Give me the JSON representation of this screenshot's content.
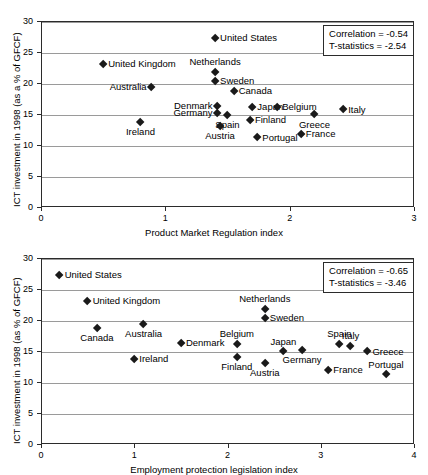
{
  "chart_data": [
    {
      "id": "top",
      "type": "scatter",
      "title": "",
      "xlabel": "Product Market Regulation index",
      "ylabel": "ICT investment in 1998 (as a % of GFCF)",
      "xlim": [
        0,
        3
      ],
      "ylim": [
        0,
        30
      ],
      "xticks": [
        "0",
        "1",
        "2",
        "3"
      ],
      "yticks": [
        "0",
        "5",
        "10",
        "15",
        "20",
        "25",
        "30"
      ],
      "grid": true,
      "annotations": {
        "correlation": "Correlation = -0.54",
        "tstatistics": "T-statistics = -2.54"
      },
      "points": [
        {
          "label": "United States",
          "x": 1.4,
          "y": 27.3,
          "pos": "right"
        },
        {
          "label": "United Kingdom",
          "x": 0.5,
          "y": 23.1,
          "pos": "right"
        },
        {
          "label": "Netherlands",
          "x": 1.4,
          "y": 21.8,
          "pos": "above"
        },
        {
          "label": "Sweden",
          "x": 1.4,
          "y": 20.3,
          "pos": "right"
        },
        {
          "label": "Australia",
          "x": 0.89,
          "y": 19.4,
          "pos": "left"
        },
        {
          "label": "Canada",
          "x": 1.55,
          "y": 18.7,
          "pos": "right"
        },
        {
          "label": "Denmark",
          "x": 1.42,
          "y": 16.3,
          "pos": "left"
        },
        {
          "label": "Japan",
          "x": 1.7,
          "y": 16.1,
          "pos": "right"
        },
        {
          "label": "Belgium",
          "x": 1.9,
          "y": 16.1,
          "pos": "right"
        },
        {
          "label": "Italy",
          "x": 2.43,
          "y": 15.7,
          "pos": "right"
        },
        {
          "label": "Germany",
          "x": 1.42,
          "y": 15.2,
          "pos": "left"
        },
        {
          "label": "Spain",
          "x": 1.5,
          "y": 14.8,
          "pos": "below"
        },
        {
          "label": "Greece",
          "x": 2.2,
          "y": 14.9,
          "pos": "below"
        },
        {
          "label": "Finland",
          "x": 1.68,
          "y": 14.0,
          "pos": "right"
        },
        {
          "label": "Ireland",
          "x": 0.8,
          "y": 13.7,
          "pos": "below"
        },
        {
          "label": "Austria",
          "x": 1.44,
          "y": 13.1,
          "pos": "below"
        },
        {
          "label": "Portugal",
          "x": 1.74,
          "y": 11.2,
          "pos": "right"
        },
        {
          "label": "France",
          "x": 2.09,
          "y": 11.8,
          "pos": "right"
        }
      ]
    },
    {
      "id": "bottom",
      "type": "scatter",
      "title": "",
      "xlabel": "Employment protection legislation index",
      "ylabel": "ICT investment in 1998 (as % of GFCF)",
      "xlim": [
        0,
        4
      ],
      "ylim": [
        0,
        30
      ],
      "xticks": [
        "0",
        "1",
        "2",
        "3",
        "4"
      ],
      "yticks": [
        "0",
        "5",
        "10",
        "15",
        "20",
        "25",
        "30"
      ],
      "grid": true,
      "annotations": {
        "correlation": "Correlation = -0.65",
        "tstatistics": "T-statistics = -3.46"
      },
      "points": [
        {
          "label": "United States",
          "x": 0.2,
          "y": 27.3,
          "pos": "right"
        },
        {
          "label": "United Kingdom",
          "x": 0.5,
          "y": 23.1,
          "pos": "right"
        },
        {
          "label": "Netherlands",
          "x": 2.4,
          "y": 21.8,
          "pos": "above"
        },
        {
          "label": "Sweden",
          "x": 2.4,
          "y": 20.3,
          "pos": "right"
        },
        {
          "label": "Australia",
          "x": 1.1,
          "y": 19.4,
          "pos": "below"
        },
        {
          "label": "Canada",
          "x": 0.6,
          "y": 18.7,
          "pos": "below"
        },
        {
          "label": "Denmark",
          "x": 1.5,
          "y": 16.3,
          "pos": "right"
        },
        {
          "label": "Belgium",
          "x": 2.1,
          "y": 16.1,
          "pos": "above"
        },
        {
          "label": "Spain",
          "x": 3.2,
          "y": 16.1,
          "pos": "above"
        },
        {
          "label": "Italy",
          "x": 3.32,
          "y": 15.8,
          "pos": "above"
        },
        {
          "label": "Japan",
          "x": 2.6,
          "y": 14.9,
          "pos": "above"
        },
        {
          "label": "Germany",
          "x": 2.8,
          "y": 15.2,
          "pos": "below"
        },
        {
          "label": "Greece",
          "x": 3.5,
          "y": 14.9,
          "pos": "right"
        },
        {
          "label": "Ireland",
          "x": 1.0,
          "y": 13.7,
          "pos": "right"
        },
        {
          "label": "Finland",
          "x": 2.1,
          "y": 14.0,
          "pos": "below"
        },
        {
          "label": "Austria",
          "x": 2.4,
          "y": 13.1,
          "pos": "below"
        },
        {
          "label": "France",
          "x": 3.08,
          "y": 11.9,
          "pos": "right"
        },
        {
          "label": "Portugal",
          "x": 3.7,
          "y": 11.2,
          "pos": "above"
        }
      ]
    }
  ]
}
